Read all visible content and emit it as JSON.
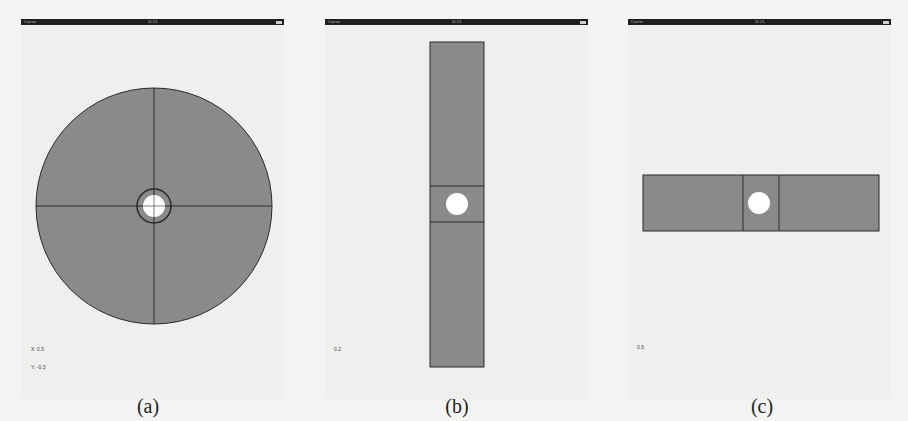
{
  "colors": {
    "page_background": "#f4f4f2",
    "screen_background": "#efefed",
    "statusbar": "#1e1e1e",
    "control_fill": "#8a8a88",
    "control_stroke": "#2a2a2a",
    "knob": "#ffffff"
  },
  "panels": [
    {
      "id": "a",
      "caption": "(a)",
      "statusbar": {
        "carrier": "Carrier",
        "time": "11:21",
        "battery": "battery-icon"
      },
      "control": "circular-joystick",
      "readouts": {
        "x": "X: 0.5",
        "y": "Y: -0.3"
      }
    },
    {
      "id": "b",
      "caption": "(b)",
      "statusbar": {
        "carrier": "Carrier",
        "time": "11:21",
        "battery": "battery-icon"
      },
      "control": "vertical-slider",
      "readouts": {
        "value": "0.2"
      }
    },
    {
      "id": "c",
      "caption": "(c)",
      "statusbar": {
        "carrier": "Carrier",
        "time": "11:21",
        "battery": "battery-icon"
      },
      "control": "horizontal-slider",
      "readouts": {
        "value": "0.5"
      }
    }
  ]
}
